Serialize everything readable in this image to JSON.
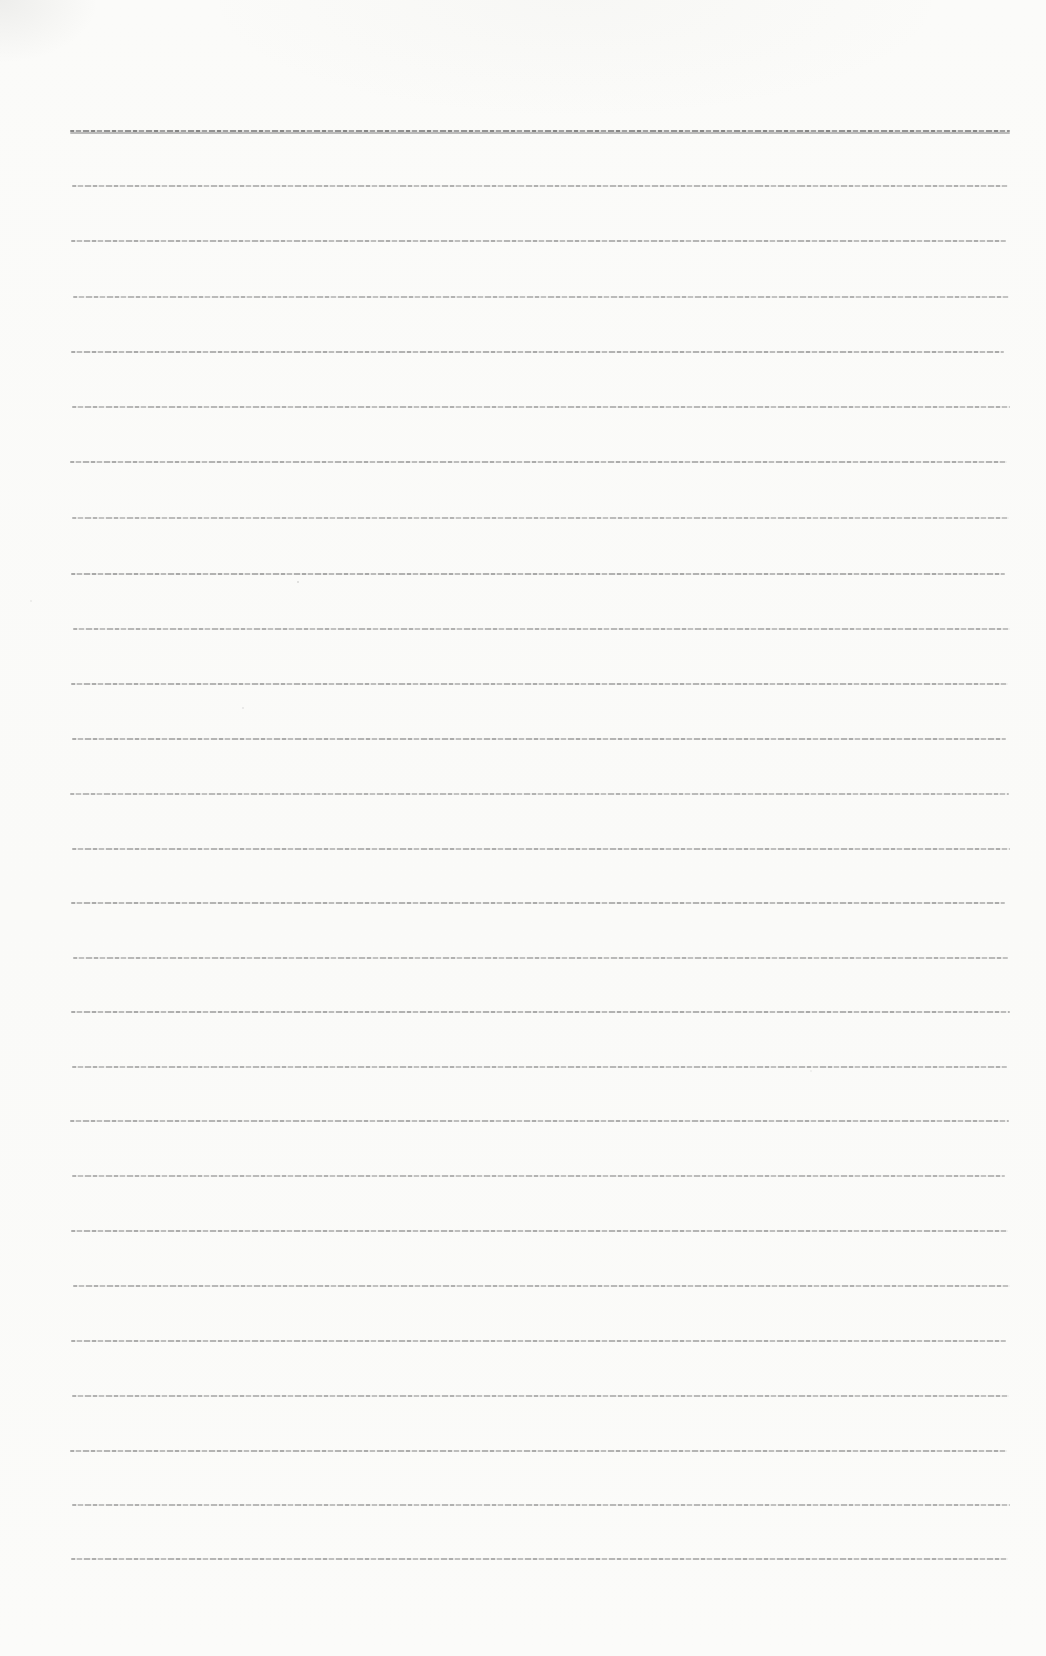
{
  "page": {
    "kind": "blank-ruled-notepad-scan",
    "background_color": "#fbfbf9",
    "rule_color": "#787878",
    "first_rule_color": "#6a6a6a",
    "line_count": 27,
    "ruled_area": {
      "left": 71,
      "right": 1010,
      "top": 130,
      "bottom": 1558,
      "spacing": 55
    },
    "text_content": ""
  },
  "lines": [
    {
      "y": 130,
      "x1": 70,
      "x2": 1010,
      "opacity": 0.92,
      "emphasis": true
    },
    {
      "y": 185,
      "x1": 72,
      "x2": 1008,
      "opacity": 0.6,
      "emphasis": false
    },
    {
      "y": 240,
      "x1": 71,
      "x2": 1006,
      "opacity": 0.63,
      "emphasis": false
    },
    {
      "y": 296,
      "x1": 73,
      "x2": 1009,
      "opacity": 0.58,
      "emphasis": false
    },
    {
      "y": 351,
      "x1": 71,
      "x2": 1004,
      "opacity": 0.65,
      "emphasis": false
    },
    {
      "y": 406,
      "x1": 72,
      "x2": 1010,
      "opacity": 0.6,
      "emphasis": false
    },
    {
      "y": 461,
      "x1": 70,
      "x2": 1007,
      "opacity": 0.64,
      "emphasis": false
    },
    {
      "y": 517,
      "x1": 72,
      "x2": 1009,
      "opacity": 0.57,
      "emphasis": false
    },
    {
      "y": 573,
      "x1": 71,
      "x2": 1005,
      "opacity": 0.66,
      "emphasis": false
    },
    {
      "y": 628,
      "x1": 73,
      "x2": 1010,
      "opacity": 0.6,
      "emphasis": false
    },
    {
      "y": 683,
      "x1": 71,
      "x2": 1008,
      "opacity": 0.63,
      "emphasis": false
    },
    {
      "y": 738,
      "x1": 72,
      "x2": 1006,
      "opacity": 0.64,
      "emphasis": false
    },
    {
      "y": 793,
      "x1": 70,
      "x2": 1009,
      "opacity": 0.58,
      "emphasis": false
    },
    {
      "y": 848,
      "x1": 72,
      "x2": 1010,
      "opacity": 0.62,
      "emphasis": false
    },
    {
      "y": 902,
      "x1": 71,
      "x2": 1005,
      "opacity": 0.64,
      "emphasis": false
    },
    {
      "y": 957,
      "x1": 73,
      "x2": 1008,
      "opacity": 0.59,
      "emphasis": false
    },
    {
      "y": 1011,
      "x1": 71,
      "x2": 1010,
      "opacity": 0.65,
      "emphasis": false
    },
    {
      "y": 1066,
      "x1": 72,
      "x2": 1007,
      "opacity": 0.6,
      "emphasis": false
    },
    {
      "y": 1120,
      "x1": 70,
      "x2": 1009,
      "opacity": 0.63,
      "emphasis": false
    },
    {
      "y": 1175,
      "x1": 72,
      "x2": 1005,
      "opacity": 0.58,
      "emphasis": false
    },
    {
      "y": 1230,
      "x1": 71,
      "x2": 1008,
      "opacity": 0.64,
      "emphasis": false
    },
    {
      "y": 1285,
      "x1": 73,
      "x2": 1010,
      "opacity": 0.6,
      "emphasis": false
    },
    {
      "y": 1340,
      "x1": 71,
      "x2": 1006,
      "opacity": 0.63,
      "emphasis": false
    },
    {
      "y": 1395,
      "x1": 72,
      "x2": 1009,
      "opacity": 0.59,
      "emphasis": false
    },
    {
      "y": 1450,
      "x1": 70,
      "x2": 1007,
      "opacity": 0.64,
      "emphasis": false
    },
    {
      "y": 1504,
      "x1": 72,
      "x2": 1010,
      "opacity": 0.6,
      "emphasis": false
    },
    {
      "y": 1558,
      "x1": 71,
      "x2": 1008,
      "opacity": 0.62,
      "emphasis": false
    }
  ],
  "speckles": [
    {
      "x": 297,
      "y": 581,
      "size": 2,
      "opacity": 0.3
    },
    {
      "x": 242,
      "y": 707,
      "size": 2,
      "opacity": 0.2
    },
    {
      "x": 30,
      "y": 600,
      "size": 2,
      "opacity": 0.14
    },
    {
      "x": 810,
      "y": 1070,
      "size": 2,
      "opacity": 0.12
    },
    {
      "x": 1105,
      "y": 35,
      "size": 2,
      "opacity": 0.1
    }
  ]
}
